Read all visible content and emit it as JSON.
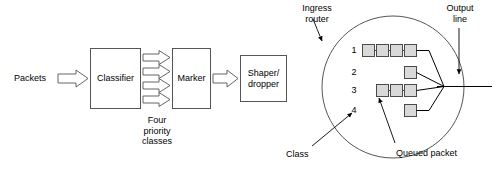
{
  "figure": {
    "left_panel": {
      "input_label": "Packets",
      "blocks": [
        {
          "id": "classifier",
          "label": "Classifier"
        },
        {
          "id": "marker",
          "label": "Marker"
        },
        {
          "id": "shaper-dropper",
          "label": "Shaper/\ndropper"
        }
      ],
      "class_arrows_count": 4,
      "caption": "Four\npriority\nclasses"
    },
    "right_panel": {
      "router_label": "Ingress\nrouter",
      "output_label": "Output\nline",
      "class_label": "Class",
      "queued_packet_label": "Queued packet",
      "queues": [
        {
          "class": "1",
          "packets": 4
        },
        {
          "class": "2",
          "packets": 1
        },
        {
          "class": "3",
          "packets": 3
        },
        {
          "class": "4",
          "packets": 1
        }
      ]
    },
    "colors": {
      "stroke": "#404040",
      "line": "#000000",
      "packet_fill": "#d9d9d9",
      "packet_stroke": "#4a4a4a",
      "background": "#ffffff"
    }
  }
}
